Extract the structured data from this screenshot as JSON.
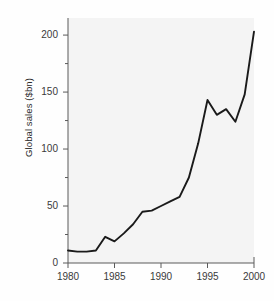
{
  "chart_data": {
    "type": "line",
    "title": "",
    "xlabel": "",
    "ylabel": "Global sales ($bn)",
    "xlim": [
      1980,
      2000
    ],
    "ylim": [
      0,
      215
    ],
    "grid": false,
    "legend": "none",
    "xticks": [
      "1980",
      "1985",
      "1990",
      "1995",
      "2000"
    ],
    "xtick_values": [
      1980,
      1985,
      1990,
      1995,
      2000
    ],
    "yticks": [
      "0",
      "50",
      "100",
      "150",
      "200"
    ],
    "ytick_values": [
      0,
      50,
      100,
      150,
      200
    ],
    "yminor_values": [
      25,
      75,
      125,
      175
    ],
    "line_color": "#1a1a1a",
    "panel_color": "#f4f4f4",
    "axis_color": "#5a5a5a",
    "x": [
      1980,
      1981,
      1982,
      1983,
      1984,
      1985,
      1986,
      1987,
      1988,
      1989,
      1990,
      1991,
      1992,
      1993,
      1994,
      1995,
      1996,
      1997,
      1998,
      1999,
      2000
    ],
    "values": [
      11,
      10,
      10,
      11,
      23,
      19,
      26,
      34,
      45,
      46,
      50,
      54,
      58,
      75,
      105,
      143,
      130,
      135,
      124,
      148,
      203
    ],
    "series": [
      {
        "name": "Global sales",
        "values": [
          11,
          10,
          10,
          11,
          23,
          19,
          26,
          34,
          45,
          46,
          50,
          54,
          58,
          75,
          105,
          143,
          130,
          135,
          124,
          148,
          203
        ]
      }
    ]
  }
}
